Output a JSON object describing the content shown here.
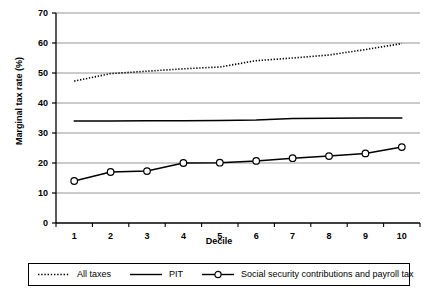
{
  "chart_data": {
    "type": "line",
    "title": "",
    "xlabel": "Decile",
    "ylabel": "Marginal tax rate (%)",
    "x": [
      1,
      2,
      3,
      4,
      5,
      6,
      7,
      8,
      9,
      10
    ],
    "xtick_labels": [
      "1",
      "2",
      "3",
      "4",
      "5",
      "6",
      "7",
      "8",
      "9",
      "10"
    ],
    "ytick_labels": [
      "0",
      "10",
      "20",
      "30",
      "40",
      "50",
      "60",
      "70"
    ],
    "ylim": [
      0,
      70
    ],
    "xlim": [
      0.5,
      10.5
    ],
    "grid": "horizontal",
    "legend_position": "bottom",
    "series": [
      {
        "name": "All taxes",
        "style": "dotted",
        "marker": "none",
        "color": "#000000",
        "values": [
          47.3,
          49.8,
          50.6,
          51.4,
          52.0,
          54.1,
          55.0,
          56.0,
          57.8,
          59.8
        ]
      },
      {
        "name": "PIT",
        "style": "solid",
        "marker": "none",
        "color": "#000000",
        "values": [
          34.0,
          34.0,
          34.1,
          34.1,
          34.2,
          34.3,
          34.8,
          34.9,
          35.0,
          35.0
        ]
      },
      {
        "name": "Social security contributions and payroll tax",
        "style": "solid",
        "marker": "circle",
        "color": "#000000",
        "values": [
          14.0,
          17.0,
          17.3,
          20.0,
          20.1,
          20.7,
          21.6,
          22.3,
          23.2,
          25.3
        ]
      }
    ]
  },
  "legend": {
    "items": [
      {
        "label": "All taxes",
        "sample": "dotted-line-sample"
      },
      {
        "label": "PIT",
        "sample": "solid-line-sample"
      },
      {
        "label": "Social security contributions and payroll tax",
        "sample": "line-with-circle-marker-sample"
      }
    ]
  }
}
